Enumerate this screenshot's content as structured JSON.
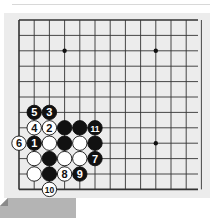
{
  "caption": {
    "figure_label": "图 1",
    "title": "正解",
    "full": "图 1　正解",
    "tab_color": "#b4b4b4",
    "text_color": "#3a3a3a"
  },
  "board": {
    "background": "#ececec",
    "line_color": "#333333",
    "origin_x": 19,
    "origin_y": 20,
    "spacing_x": 15.2,
    "spacing_y": 15.4,
    "columns": 13,
    "rows": 12,
    "edges": [
      "left",
      "top",
      "bottom"
    ],
    "star_points": [
      {
        "col": 3,
        "row": 2
      },
      {
        "col": 9,
        "row": 2
      },
      {
        "col": 9,
        "row": 8
      }
    ]
  },
  "stones": [
    {
      "color": "black",
      "col": 1,
      "row": 6,
      "label": "5"
    },
    {
      "color": "black",
      "col": 2,
      "row": 6,
      "label": "3"
    },
    {
      "color": "white",
      "col": 1,
      "row": 7,
      "label": "4"
    },
    {
      "color": "white",
      "col": 2,
      "row": 7,
      "label": "2"
    },
    {
      "color": "black",
      "col": 3,
      "row": 7,
      "label": ""
    },
    {
      "color": "black",
      "col": 4,
      "row": 7,
      "label": ""
    },
    {
      "color": "black",
      "col": 5,
      "row": 7,
      "label": "11"
    },
    {
      "color": "white",
      "col": 0,
      "row": 8,
      "label": "6"
    },
    {
      "color": "black",
      "col": 1,
      "row": 8,
      "label": "1"
    },
    {
      "color": "white",
      "col": 2,
      "row": 8,
      "label": ""
    },
    {
      "color": "black",
      "col": 3,
      "row": 8,
      "label": ""
    },
    {
      "color": "white",
      "col": 4,
      "row": 8,
      "label": ""
    },
    {
      "color": "black",
      "col": 5,
      "row": 8,
      "label": ""
    },
    {
      "color": "white",
      "col": 1,
      "row": 9,
      "label": ""
    },
    {
      "color": "black",
      "col": 2,
      "row": 9,
      "label": ""
    },
    {
      "color": "white",
      "col": 3,
      "row": 9,
      "label": ""
    },
    {
      "color": "white",
      "col": 4,
      "row": 9,
      "label": ""
    },
    {
      "color": "black",
      "col": 5,
      "row": 9,
      "label": "7"
    },
    {
      "color": "white",
      "col": 1,
      "row": 10,
      "label": ""
    },
    {
      "color": "black",
      "col": 2,
      "row": 10,
      "label": ""
    },
    {
      "color": "white",
      "col": 3,
      "row": 10,
      "label": "8"
    },
    {
      "color": "black",
      "col": 4,
      "row": 10,
      "label": "9"
    },
    {
      "color": "white",
      "col": 2,
      "row": 11,
      "label": "10"
    }
  ]
}
